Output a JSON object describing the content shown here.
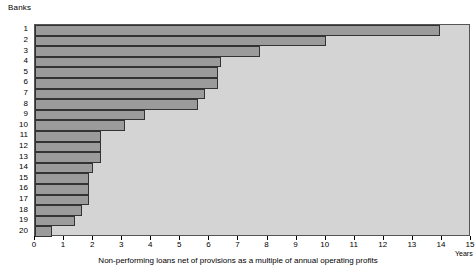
{
  "chart_data": {
    "type": "bar",
    "orientation": "horizontal",
    "title": "",
    "ylabel": "Banks",
    "xlabel": "Non-performing loans net of provisions as a multiple of annual operating profits",
    "x_unit_label": "Years",
    "categories": [
      "1",
      "2",
      "3",
      "4",
      "5",
      "6",
      "7",
      "8",
      "9",
      "10",
      "11",
      "12",
      "13",
      "14",
      "15",
      "16",
      "17",
      "18",
      "19",
      "20"
    ],
    "values": [
      13.95,
      10.0,
      7.75,
      6.4,
      6.3,
      6.3,
      5.85,
      5.6,
      3.8,
      3.1,
      2.27,
      2.27,
      2.27,
      2.0,
      1.85,
      1.85,
      1.85,
      1.6,
      1.38,
      0.6
    ],
    "xlim": [
      0,
      15
    ],
    "xticks": [
      0,
      1,
      2,
      3,
      4,
      5,
      6,
      7,
      8,
      9,
      10,
      11,
      12,
      13,
      14,
      15
    ],
    "xtick_labels": [
      "0",
      "1",
      "2",
      "3",
      "4",
      "5",
      "6",
      "7",
      "8",
      "9",
      "10",
      "11",
      "12",
      "13",
      "14",
      "15"
    ],
    "grid": false,
    "legend": null,
    "colors": {
      "bar_fill": "#9b9b9b",
      "bar_border": "#333333",
      "plot_background": "#d4d4d4",
      "axis": "#555555",
      "text": "#000000"
    }
  }
}
